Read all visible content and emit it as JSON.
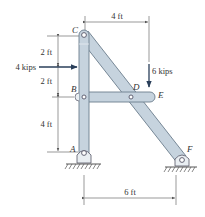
{
  "figure": {
    "type": "frame-structure",
    "points": {
      "A": {
        "label": "A",
        "support": "pin"
      },
      "B": {
        "label": "B",
        "support": "pin-joint"
      },
      "C": {
        "label": "C",
        "support": "pin-joint"
      },
      "D": {
        "label": "D",
        "support": "pin-joint"
      },
      "E": {
        "label": "E",
        "support": "free-end"
      },
      "F": {
        "label": "F",
        "support": "pin"
      }
    },
    "members": [
      "ABC",
      "CDF",
      "BDE"
    ],
    "loads": [
      {
        "label": "4 kips",
        "direction": "right",
        "point": "on ABC, 2 ft below C"
      },
      {
        "label": "6 kips",
        "direction": "down",
        "point": "E"
      }
    ],
    "dimensions": {
      "top": "4 ft",
      "left_upper": "2 ft",
      "left_middle": "2 ft",
      "left_lower": "4 ft",
      "bottom": "6 ft"
    }
  }
}
